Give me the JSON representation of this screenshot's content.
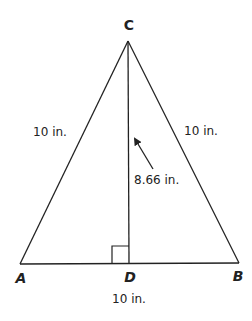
{
  "diagram": {
    "vertices": {
      "C": {
        "label": "C",
        "x": 128,
        "y": 41
      },
      "A": {
        "label": "A",
        "x": 20,
        "y": 264
      },
      "B": {
        "label": "B",
        "x": 239,
        "y": 263
      },
      "D": {
        "label": "D",
        "x": 129,
        "y": 263
      }
    },
    "measurements": {
      "side_ac": "10 in.",
      "side_bc": "10 in.",
      "altitude_cd": "8.66 in.",
      "base_ab": "10 in."
    },
    "annotations": {
      "right_angle_at": "D",
      "arrow_points_to": "altitude CD"
    },
    "colors": {
      "stroke": "#222222",
      "background": "#ffffff"
    }
  }
}
